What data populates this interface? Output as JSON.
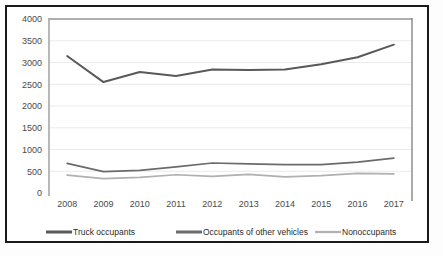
{
  "chart_data": {
    "type": "line",
    "title": "",
    "subtitle": "",
    "xlabel": "",
    "ylabel": "",
    "categories": [
      "2008",
      "2009",
      "2010",
      "2011",
      "2012",
      "2013",
      "2014",
      "2015",
      "2016",
      "2017"
    ],
    "x": [
      2008,
      2009,
      2010,
      2011,
      2012,
      2013,
      2014,
      2015,
      2016,
      2017
    ],
    "series": [
      {
        "name": "Truck occupants",
        "color": "#595959",
        "values": [
          3150,
          2550,
          2780,
          2690,
          2840,
          2830,
          2840,
          2960,
          3120,
          3410
        ]
      },
      {
        "name": "Occupants of other vehicles",
        "color": "#6b6b6b",
        "values": [
          680,
          490,
          520,
          600,
          690,
          670,
          650,
          650,
          710,
          800
        ]
      },
      {
        "name": "Nonoccupants",
        "color": "#b0b0b0",
        "values": [
          410,
          330,
          360,
          420,
          380,
          430,
          370,
          400,
          450,
          440
        ]
      }
    ],
    "ylim": [
      0,
      4000
    ],
    "yticks": [
      0,
      500,
      1000,
      1500,
      2000,
      2500,
      3000,
      3500,
      4000
    ],
    "ytick_labels": [
      "0",
      "500",
      "1000",
      "1500",
      "2000",
      "2500",
      "3000",
      "3500",
      "4000"
    ],
    "grid": true,
    "grid_axis": "y",
    "legend_position": "bottom",
    "legend_entries": [
      "Truck occupants",
      "Occupants of other vehicles",
      "Nonoccupants"
    ],
    "annotations": []
  },
  "colors": {
    "frame": "#1a1a1a",
    "plot_background": "#ffffff",
    "gridline": "#e6e6e6",
    "axis": "#9a9a9a",
    "tick_text": "#4a4a4a",
    "legend_text": "#2b2b2b"
  }
}
